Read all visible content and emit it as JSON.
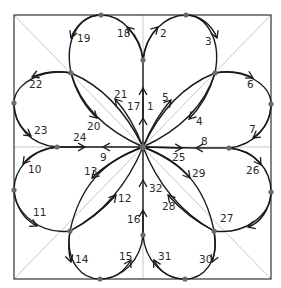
{
  "diagram": {
    "title": "",
    "center": {
      "x": 143,
      "y": 147
    },
    "frame": {
      "x1": 14,
      "y1": 15,
      "x2": 271,
      "y2": 279
    },
    "colors": {
      "stroke": "#1a1a1a",
      "guide": "#c8c8c8",
      "dot": "#6b6b6b",
      "frame": "#333333"
    },
    "nodes": {
      "C": {
        "x": 143,
        "y": 147
      },
      "T": {
        "x": 143,
        "y": 60
      },
      "B": {
        "x": 143,
        "y": 235
      },
      "L": {
        "x": 57,
        "y": 147
      },
      "R": {
        "x": 229,
        "y": 148
      },
      "NW": {
        "x": 71,
        "y": 73
      },
      "NE": {
        "x": 215,
        "y": 73
      },
      "SW": {
        "x": 70,
        "y": 231
      },
      "SE": {
        "x": 214,
        "y": 231
      },
      "TL": {
        "x": 101,
        "y": 15
      },
      "TR": {
        "x": 186,
        "y": 15
      },
      "BL": {
        "x": 100,
        "y": 279
      },
      "BR": {
        "x": 185,
        "y": 279
      },
      "LT": {
        "x": 14,
        "y": 103
      },
      "LB": {
        "x": 14,
        "y": 190
      },
      "RT": {
        "x": 271,
        "y": 104
      },
      "RB": {
        "x": 271,
        "y": 192
      }
    },
    "labels": [
      {
        "text": "1",
        "x": 147,
        "y": 110
      },
      {
        "text": "2",
        "x": 160,
        "y": 37
      },
      {
        "text": "3",
        "x": 205,
        "y": 45
      },
      {
        "text": "4",
        "x": 196,
        "y": 125
      },
      {
        "text": "5",
        "x": 162,
        "y": 101
      },
      {
        "text": "6",
        "x": 247,
        "y": 88
      },
      {
        "text": "7",
        "x": 249,
        "y": 133
      },
      {
        "text": "8",
        "x": 201,
        "y": 145
      },
      {
        "text": "9",
        "x": 100,
        "y": 161
      },
      {
        "text": "10",
        "x": 28,
        "y": 173
      },
      {
        "text": "11",
        "x": 33,
        "y": 216
      },
      {
        "text": "12",
        "x": 118,
        "y": 202
      },
      {
        "text": "13",
        "x": 84,
        "y": 175
      },
      {
        "text": "14",
        "x": 75,
        "y": 263
      },
      {
        "text": "15",
        "x": 119,
        "y": 260
      },
      {
        "text": "16",
        "x": 127,
        "y": 223
      },
      {
        "text": "17",
        "x": 127,
        "y": 110
      },
      {
        "text": "18",
        "x": 117,
        "y": 37
      },
      {
        "text": "19",
        "x": 77,
        "y": 42
      },
      {
        "text": "20",
        "x": 87,
        "y": 130
      },
      {
        "text": "21",
        "x": 114,
        "y": 98
      },
      {
        "text": "22",
        "x": 29,
        "y": 88
      },
      {
        "text": "23",
        "x": 34,
        "y": 134
      },
      {
        "text": "24",
        "x": 73,
        "y": 141
      },
      {
        "text": "25",
        "x": 172,
        "y": 161
      },
      {
        "text": "26",
        "x": 246,
        "y": 174
      },
      {
        "text": "27",
        "x": 220,
        "y": 222
      },
      {
        "text": "28",
        "x": 162,
        "y": 210
      },
      {
        "text": "29",
        "x": 192,
        "y": 177
      },
      {
        "text": "30",
        "x": 199,
        "y": 263
      },
      {
        "text": "31",
        "x": 158,
        "y": 260
      },
      {
        "text": "32",
        "x": 149,
        "y": 192
      }
    ]
  }
}
